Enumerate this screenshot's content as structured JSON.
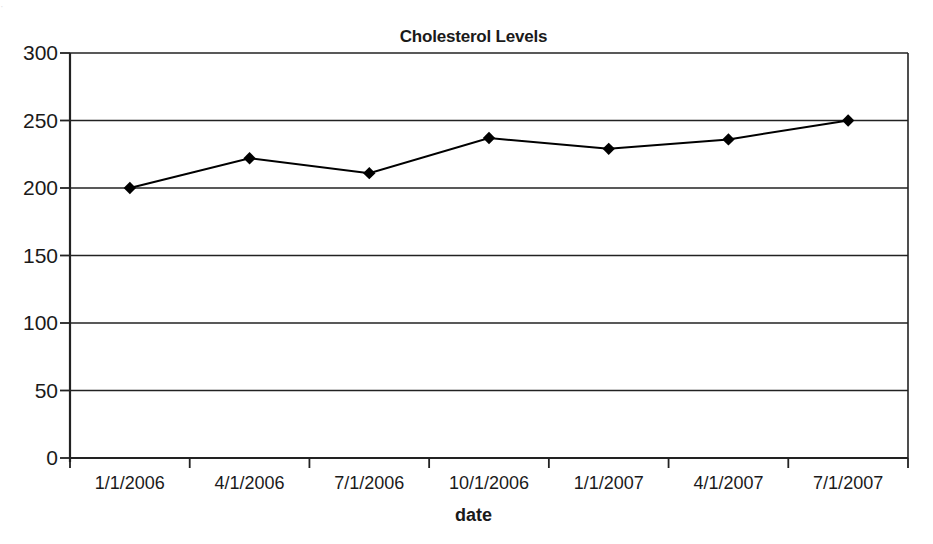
{
  "scan": {
    "artifact_text": "·"
  },
  "chart_data": {
    "type": "line",
    "title": "Cholesterol Levels",
    "xlabel": "date",
    "ylabel": "",
    "categories": [
      "1/1/2006",
      "4/1/2006",
      "7/1/2006",
      "10/1/2006",
      "1/1/2007",
      "4/1/2007",
      "7/1/2007"
    ],
    "values": [
      200,
      222,
      211,
      237,
      229,
      236,
      250
    ],
    "series": [
      {
        "name": "Cholesterol",
        "values": [
          200,
          222,
          211,
          237,
          229,
          236,
          250
        ]
      }
    ],
    "ylim": [
      0,
      300
    ],
    "yticks": [
      0,
      50,
      100,
      150,
      200,
      250,
      300
    ],
    "ytick_labels": [
      "0",
      "50",
      "100",
      "150",
      "200",
      "250",
      "300"
    ],
    "grid": "horizontal",
    "legend": "none",
    "marker": "diamond",
    "line_color": "#000000",
    "marker_color": "#000000",
    "grid_color": "#222222",
    "axis_color": "#222222"
  }
}
